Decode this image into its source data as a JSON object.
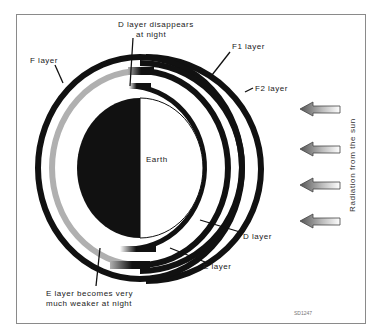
{
  "diagram": {
    "center_label": "Earth",
    "labels": {
      "d_disappears": [
        "D layer disappears",
        "at night"
      ],
      "f1_layer": "F1 layer",
      "f2_layer": "F2 layer",
      "f_layer": "F layer",
      "d_layer": "D layer",
      "e_layer": "E layer",
      "e_weaker": [
        "E layer becomes very",
        "much weaker at night"
      ],
      "radiation": "Radiation from the sun",
      "figure_code": "SD1247"
    },
    "arrows": {
      "count": 4,
      "direction": "left",
      "meaning": "Radiation from the sun"
    },
    "layers": [
      {
        "name": "D layer",
        "day": "present",
        "night": "disappears"
      },
      {
        "name": "E layer",
        "day": "strong",
        "night": "much weaker (grey)"
      },
      {
        "name": "F1 layer",
        "day": "separate",
        "night": "merges into F"
      },
      {
        "name": "F2 layer",
        "day": "separate",
        "night": "merges into F"
      },
      {
        "name": "F layer",
        "day": "split into F1/F2",
        "night": "single layer"
      }
    ],
    "colors": {
      "ring": "#111111",
      "night_e": "#b0b0b0",
      "earth_night": "#111111",
      "earth_day": "#ffffff",
      "frame": "#8a8a8a"
    }
  }
}
